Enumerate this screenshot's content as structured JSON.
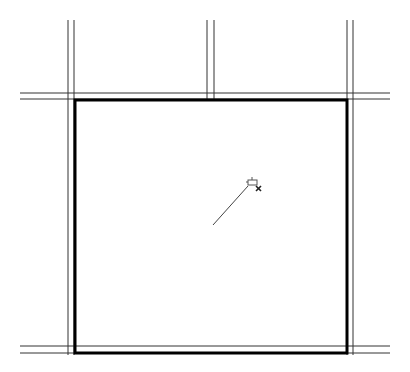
{
  "canvas": {
    "width": 410,
    "height": 372,
    "background": "#ffffff",
    "line_color": "#333333",
    "thick_color": "#000000"
  },
  "walls": {
    "vertical": [
      {
        "name": "left-wall",
        "x1": 68,
        "x2": 74,
        "y_top": 20,
        "y_bottom": 355
      },
      {
        "name": "middle-wall",
        "x1": 207,
        "x2": 214,
        "y_top": 20,
        "y_bottom": 99
      },
      {
        "name": "right-wall",
        "x1": 347,
        "x2": 353,
        "y_top": 20,
        "y_bottom": 355
      }
    ],
    "horizontal": [
      {
        "name": "top-wall",
        "y1": 93,
        "y2": 99,
        "x_left": 20,
        "x_right": 390
      },
      {
        "name": "bottom-wall",
        "y1": 346,
        "y2": 353,
        "x_left": 20,
        "x_right": 390
      }
    ]
  },
  "selection_rect": {
    "x": 74,
    "y": 99,
    "width": 273,
    "height": 254,
    "stroke_width": 3
  },
  "drag_line": {
    "x1": 213,
    "y1": 225,
    "x2": 248,
    "y2": 186
  },
  "cursor": {
    "type": "pin-move-cursor",
    "x": 248,
    "y": 178
  }
}
